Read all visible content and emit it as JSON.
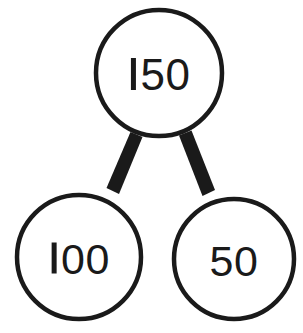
{
  "diagram": {
    "type": "number-bond",
    "background_color": "#ffffff",
    "stroke_color": "#1a1a1a",
    "text_color": "#1a1a1a",
    "circle_fill": "#ffffff",
    "circle_stroke_width": 4,
    "connector_stroke_width": 11,
    "nodes": {
      "total": {
        "label": "150",
        "value": 150,
        "role": "whole",
        "cx": 159,
        "cy": 73,
        "r": 65
      },
      "part_left": {
        "label": "100",
        "value": 100,
        "role": "part",
        "cx": 79,
        "cy": 257,
        "r": 64
      },
      "part_right": {
        "label": "50",
        "value": 50,
        "role": "part",
        "cx": 234,
        "cy": 259,
        "r": 62
      }
    },
    "connectors": [
      {
        "name": "total-to-left",
        "from": "total",
        "to": "part_left"
      },
      {
        "name": "total-to-right",
        "from": "total",
        "to": "part_right"
      }
    ]
  }
}
